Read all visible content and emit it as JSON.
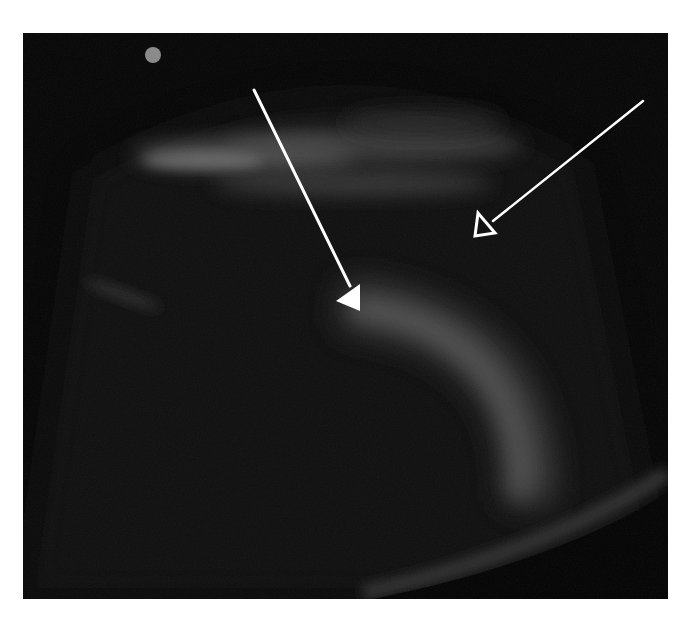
{
  "image": {
    "kind": "ultrasound-scan",
    "background_color": "#050505",
    "page_background": "#ffffff"
  },
  "markers": {
    "orientation_dot": {
      "cx": 130,
      "cy": 22,
      "r": 8,
      "color": "#8a8a8a"
    }
  },
  "annotations": [
    {
      "id": "filled-arrow",
      "style": "filled",
      "x1": 231,
      "y1": 57,
      "x2": 337,
      "y2": 272,
      "color": "#ffffff"
    },
    {
      "id": "open-arrow",
      "style": "open",
      "x1": 620,
      "y1": 68,
      "x2": 452,
      "y2": 203,
      "color": "#ffffff"
    }
  ]
}
